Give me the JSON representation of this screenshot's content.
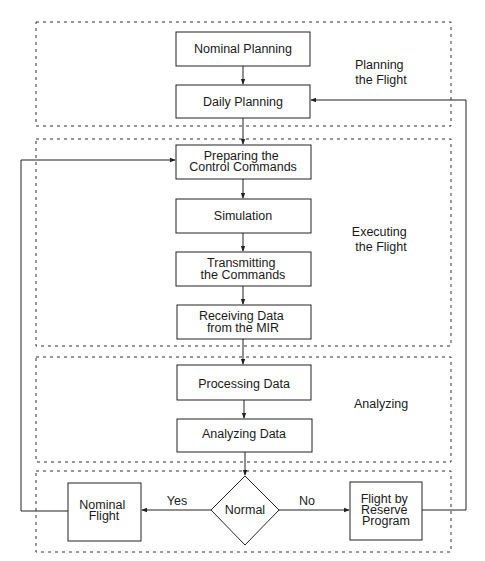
{
  "sections": [
    {
      "id": "planning",
      "label_lines": [
        "Planning",
        "the Flight"
      ]
    },
    {
      "id": "executing",
      "label_lines": [
        "Executing",
        "the Flight"
      ]
    },
    {
      "id": "analyzing",
      "label_lines": [
        "Analyzing"
      ]
    },
    {
      "id": "decision",
      "label_lines": []
    }
  ],
  "nodes": {
    "nominal_planning": {
      "lines": [
        "Nominal Planning"
      ]
    },
    "daily_planning": {
      "lines": [
        "Daily Planning"
      ]
    },
    "preparing": {
      "lines": [
        "Preparing the",
        "Control Commands"
      ]
    },
    "simulation": {
      "lines": [
        "Simulation"
      ]
    },
    "transmitting": {
      "lines": [
        "Transmitting",
        "the Commands"
      ]
    },
    "receiving": {
      "lines": [
        "Receiving Data",
        "from the MIR"
      ]
    },
    "processing": {
      "lines": [
        "Processing Data"
      ]
    },
    "analyzing_data": {
      "lines": [
        "Analyzing Data"
      ]
    },
    "normal": {
      "lines": [
        "Normal"
      ]
    },
    "nominal_flight": {
      "lines": [
        "Nominal",
        "Flight"
      ]
    },
    "reserve": {
      "lines": [
        "Flight by",
        "Reserve",
        "Program"
      ]
    }
  },
  "edges": {
    "yes_label": "Yes",
    "no_label": "No"
  },
  "colors": {
    "stroke": "#222222",
    "text": "#1a1a1a",
    "background": "#ffffff"
  }
}
